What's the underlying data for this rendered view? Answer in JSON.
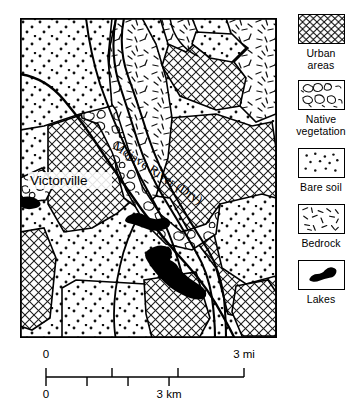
{
  "map": {
    "labels": {
      "city": "Victorville",
      "river": "Mojave River (Dry)"
    }
  },
  "legend": {
    "items": [
      {
        "label": "Urban\nareas",
        "pattern": "crosshatch-pattern",
        "name": "urban-areas"
      },
      {
        "label": "Native\nvegetation",
        "pattern": "blob-pattern",
        "name": "native-vegetation"
      },
      {
        "label": "Bare soil",
        "pattern": "stipple-pattern",
        "name": "bare-soil"
      },
      {
        "label": "Bedrock",
        "pattern": "dash-pattern",
        "name": "bedrock"
      },
      {
        "label": "Lakes",
        "pattern": "solid-lake",
        "name": "lakes"
      }
    ]
  },
  "scale_bars": [
    {
      "name": "miles",
      "start_label": "0",
      "end_label": "3 mi",
      "ticks": [
        0,
        1,
        2,
        3
      ],
      "max": 3,
      "unit": "mi",
      "side": "above"
    },
    {
      "name": "kilometers",
      "start_label": "0",
      "end_label": "3 km",
      "ticks": [
        0,
        1,
        2,
        3
      ],
      "max": 4.828,
      "unit": "km",
      "side": "below"
    }
  ],
  "colors": {
    "ink": "#000000",
    "paper": "#ffffff"
  }
}
